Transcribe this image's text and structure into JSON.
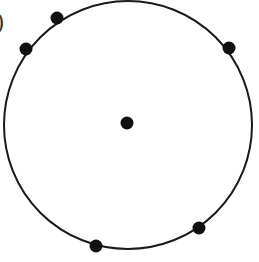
{
  "diagram": {
    "label_fragment": ")",
    "colors": {
      "stroke": "#1a1a1a",
      "dot": "#111111",
      "background": "#ffffff"
    },
    "circle": {
      "cx": 128,
      "cy": 125,
      "r": 124
    },
    "center_point": {
      "x": 127,
      "y": 123,
      "r": 6.5
    },
    "boundary_points": [
      {
        "x": 57,
        "y": 18,
        "r": 6.5
      },
      {
        "x": 26,
        "y": 49,
        "r": 6.5
      },
      {
        "x": 229,
        "y": 48,
        "r": 6.5
      },
      {
        "x": 199,
        "y": 228,
        "r": 6.5
      },
      {
        "x": 96,
        "y": 246,
        "r": 6.5
      }
    ]
  }
}
